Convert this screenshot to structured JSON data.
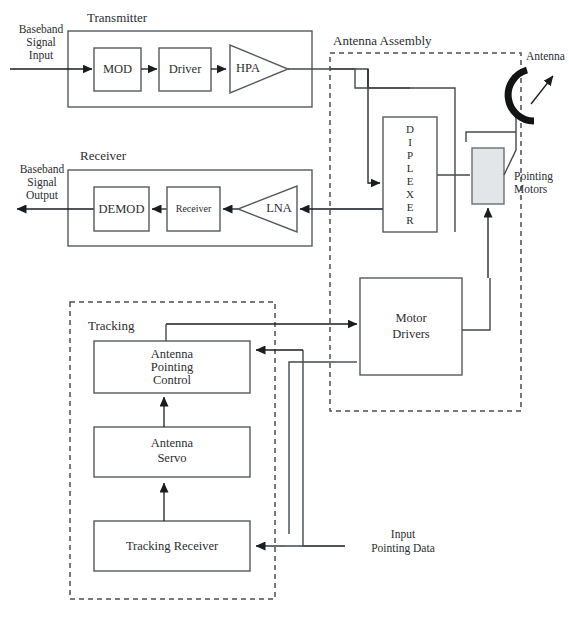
{
  "figure": {
    "background_color": "#ffffff",
    "line_color": "#45494d",
    "dashed_color": "#4a4f53",
    "gray_fill": "#e2e6e8"
  },
  "sections": {
    "transmitter_label": "Transmitter",
    "receiver_label": "Receiver",
    "antenna_assembly_label": "Antenna Assembly",
    "tracking_label": "Tracking"
  },
  "transmitter": {
    "blocks": [
      {
        "name": "mod",
        "label": "MOD",
        "shape": "rect"
      },
      {
        "name": "driver",
        "label": "Driver",
        "shape": "rect"
      },
      {
        "name": "hpa",
        "label": "HPA",
        "shape": "triangle"
      }
    ]
  },
  "receiver": {
    "blocks": [
      {
        "name": "demod",
        "label": "DEMOD",
        "shape": "rect"
      },
      {
        "name": "receiver",
        "label": "Receiver",
        "shape": "rect"
      },
      {
        "name": "lna",
        "label": "LNA",
        "shape": "triangle"
      }
    ]
  },
  "antenna_assembly": {
    "diplexer_label": "DIPLEXER",
    "diplexer_letters": [
      "D",
      "I",
      "P",
      "L",
      "E",
      "X",
      "E",
      "R"
    ],
    "antenna_label": "Antenna",
    "pointing_motors_label_line1": "Pointing",
    "pointing_motors_label_line2": "Motors"
  },
  "tracking": {
    "blocks": [
      {
        "name": "antenna-pointing-control",
        "lines": [
          "Antenna",
          "Pointing",
          "Control"
        ]
      },
      {
        "name": "antenna-servo",
        "lines": [
          "Antenna",
          "Servo"
        ]
      },
      {
        "name": "tracking-receiver",
        "lines": [
          "Tracking Receiver"
        ]
      }
    ]
  },
  "motor_drivers": {
    "lines": [
      "Motor",
      "Drivers"
    ]
  },
  "io_labels": {
    "baseband_input": [
      "Baseband",
      "Signal",
      "Input"
    ],
    "baseband_output": [
      "Baseband",
      "Signal",
      "Output"
    ],
    "input_pointing_data": [
      "Input",
      "Pointing Data"
    ]
  }
}
